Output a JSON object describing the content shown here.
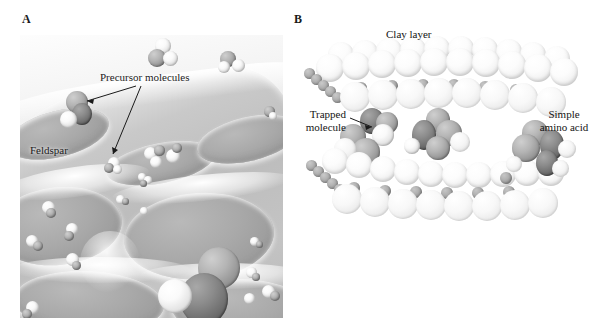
{
  "figure": {
    "panels": [
      {
        "letter": "A",
        "name": "feldspar-surface-panel",
        "labels": [
          {
            "id": "precursor",
            "text": "Precursor molecules",
            "leaders": 2
          },
          {
            "id": "feldspar",
            "text": "Feldspar",
            "leaders": 0
          }
        ]
      },
      {
        "letter": "B",
        "name": "clay-layer-panel",
        "labels": [
          {
            "id": "clay-layer",
            "text": "Clay layer",
            "leaders": 0
          },
          {
            "id": "trapped-molecule",
            "text_line1": "Trapped",
            "text_line2": "molecule",
            "leaders": 1
          },
          {
            "id": "simple-amino-acid",
            "text_line1": "Simple",
            "text_line2": "amino acid",
            "leaders": 0
          }
        ]
      }
    ]
  },
  "colors": {
    "background": "#ffffff",
    "text": "#141414",
    "rock_light": "#fbfbfb",
    "rock_mid": "#c4c4c4",
    "rock_dark": "#9d9d9d",
    "atom_white": "#ffffff",
    "atom_gray": "#b4b4b4",
    "atom_dark": "#6b6b6b",
    "clay_pale": "#f4f4f4",
    "clay_small": "#9a9a9a"
  },
  "panelA": {
    "letter": "A",
    "feldspar_label": "Feldspar",
    "precursor_label": "Precursor molecules",
    "molecule_count_visible": 22
  },
  "panelB": {
    "letter": "B",
    "clay_label": "Clay layer",
    "trapped_line1": "Trapped",
    "trapped_line2": "molecule",
    "amino_line1": "Simple",
    "amino_line2": "amino acid",
    "clay_layers": 2
  }
}
